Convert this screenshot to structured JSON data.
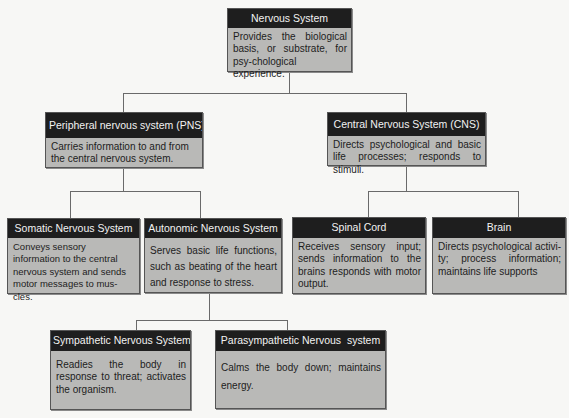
{
  "diagram": {
    "type": "hierarchy",
    "root": {
      "title": "Nervous System",
      "description": "Provides the biological basis, or substrate, for psy-chological experience."
    },
    "pns": {
      "title": "Peripheral nervous system (PNS)",
      "description": "Carries information to and from the central nervous system."
    },
    "cns": {
      "title": "Central Nervous System (CNS)",
      "description": "Directs psychological and basic life processes; responds to stimuli."
    },
    "somatic": {
      "title": "Somatic Nervous System",
      "description": "Conveys sensory information to the central nervous system and sends motor messages to mus-cles."
    },
    "autonomic": {
      "title": "Autonomic Nervous System",
      "description": "Serves basic life functions, such as beating of the heart and response to stress."
    },
    "spinal_cord": {
      "title": "Spinal Cord",
      "description": "Receives sensory input; sends information to the brains responds with motor output."
    },
    "brain": {
      "title": "Brain",
      "description": "Directs psychological activi-ty; process information; maintains life supports"
    },
    "sympathetic": {
      "title": "Sympathetic Nervous System",
      "description": "Readies the body in response to threat; activates the organism."
    },
    "parasympathetic": {
      "title": "Parasympathetic Nervous  system",
      "description": "Calms the body down; maintains energy."
    },
    "edges": [
      [
        "Nervous System",
        "Peripheral nervous system (PNS)"
      ],
      [
        "Nervous System",
        "Central Nervous System (CNS)"
      ],
      [
        "Peripheral nervous system (PNS)",
        "Somatic Nervous System"
      ],
      [
        "Peripheral nervous system (PNS)",
        "Autonomic Nervous System"
      ],
      [
        "Central Nervous System (CNS)",
        "Spinal Cord"
      ],
      [
        "Central Nervous System (CNS)",
        "Brain"
      ],
      [
        "Autonomic Nervous System",
        "Sympathetic Nervous System"
      ],
      [
        "Autonomic Nervous System",
        "Parasympathetic Nervous  system"
      ]
    ]
  },
  "colors": {
    "header_bg": "#1e1e1e",
    "header_text": "#f2f2f2",
    "box_bg": "#b9b9b7",
    "connector": "#6a6a6a",
    "page_bg": "#f7f7f5"
  }
}
